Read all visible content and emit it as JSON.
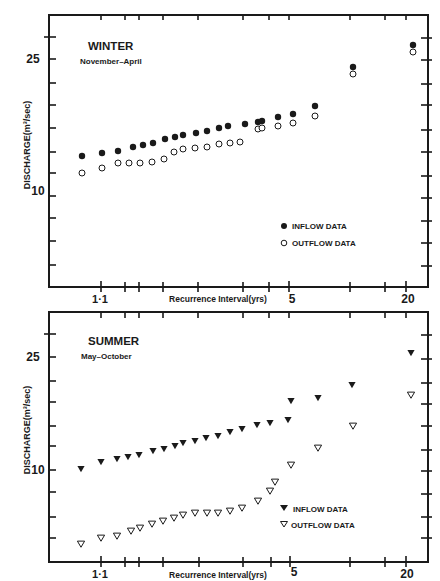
{
  "chart_data": [
    {
      "type": "scatter",
      "title": "WINTER",
      "subtitle": "November–April",
      "xlabel": "Recurrence Interval(yrs)",
      "ylabel": "DISCHARGE(m³/sec)",
      "xscale": "probability (log-extreme)",
      "x_tick_labels": [
        "1·1",
        "5",
        "20"
      ],
      "y_tick_labels": [
        "25",
        "10"
      ],
      "legend": [
        {
          "label": "INFLOW DATA",
          "marker": "filled-circle"
        },
        {
          "label": "OUTFLOW DATA",
          "marker": "open-circle"
        }
      ],
      "legend_position": "lower right",
      "grid": false,
      "series": [
        {
          "name": "INFLOW DATA",
          "marker": "filled-circle",
          "points_px": [
            [
              82,
              156
            ],
            [
              102,
              153
            ],
            [
              118,
              151
            ],
            [
              133,
              147
            ],
            [
              143,
              145
            ],
            [
              153,
              143
            ],
            [
              165,
              139
            ],
            [
              175,
              137
            ],
            [
              183,
              135
            ],
            [
              196,
              133
            ],
            [
              207,
              131
            ],
            [
              219,
              128
            ],
            [
              228,
              126
            ],
            [
              245,
              124
            ],
            [
              258,
              122
            ],
            [
              262,
              121
            ],
            [
              278,
              117
            ],
            [
              293,
              114
            ],
            [
              315,
              106
            ],
            [
              353,
              67
            ],
            [
              413,
              45
            ]
          ],
          "recurrence_yrs": [
            1.02,
            1.1,
            1.15,
            1.2,
            1.25,
            1.3,
            1.38,
            1.45,
            1.52,
            1.6,
            1.7,
            1.85,
            2.0,
            2.3,
            2.6,
            2.8,
            3.3,
            4.0,
            5.5,
            10,
            22
          ],
          "discharge_m3s": [
            14.5,
            15,
            15.3,
            15.8,
            16,
            16.3,
            16.8,
            17.2,
            17.5,
            17.8,
            18.1,
            18.6,
            19,
            19.4,
            19.8,
            20,
            20.6,
            21.2,
            22.8,
            30,
            35
          ]
        },
        {
          "name": "OUTFLOW DATA",
          "marker": "open-circle",
          "points_px": [
            [
              82,
              173
            ],
            [
              102,
              168
            ],
            [
              118,
              163
            ],
            [
              129,
              163
            ],
            [
              140,
              163
            ],
            [
              152,
              162
            ],
            [
              164,
              159
            ],
            [
              174,
              152
            ],
            [
              183,
              149
            ],
            [
              195,
              148
            ],
            [
              207,
              147
            ],
            [
              219,
              144
            ],
            [
              230,
              143
            ],
            [
              240,
              142
            ],
            [
              258,
              129
            ],
            [
              262,
              128
            ],
            [
              278,
              126
            ],
            [
              293,
              123
            ],
            [
              315,
              116
            ],
            [
              353,
              74
            ],
            [
              413,
              52
            ]
          ],
          "recurrence_yrs": [
            1.02,
            1.1,
            1.15,
            1.2,
            1.25,
            1.3,
            1.38,
            1.45,
            1.52,
            1.6,
            1.7,
            1.85,
            2.0,
            2.3,
            2.6,
            2.8,
            3.3,
            4.0,
            5.5,
            10,
            22
          ],
          "discharge_m3s": [
            12.3,
            12.8,
            13.3,
            13.3,
            13.3,
            13.4,
            13.7,
            14.4,
            14.8,
            15,
            15.1,
            15.5,
            15.6,
            15.7,
            17.3,
            17.4,
            17.8,
            18.2,
            19.4,
            28,
            33.5
          ]
        }
      ]
    },
    {
      "type": "scatter",
      "title": "SUMMER",
      "subtitle": "May–October",
      "xlabel": "Recurrence Interval(yrs)",
      "ylabel": "DISCHARGE(m³/sec)",
      "xscale": "probability (log-extreme)",
      "x_tick_labels": [
        "1·1",
        "5",
        "20"
      ],
      "y_tick_labels": [
        "25",
        "10"
      ],
      "legend": [
        {
          "label": "INFLOW DATA",
          "marker": "filled-triangle-down"
        },
        {
          "label": "OUTFLOW DATA",
          "marker": "open-triangle-down"
        }
      ],
      "legend_position": "lower right",
      "grid": false,
      "series": [
        {
          "name": "INFLOW DATA",
          "marker": "filled-triangle-down",
          "points_px": [
            [
              81,
              469
            ],
            [
              101,
              462
            ],
            [
              117,
              459
            ],
            [
              128,
              457
            ],
            [
              139,
              455
            ],
            [
              153,
              451
            ],
            [
              164,
              449
            ],
            [
              175,
              446
            ],
            [
              183,
              443
            ],
            [
              195,
              441
            ],
            [
              206,
              438
            ],
            [
              218,
              436
            ],
            [
              230,
              432
            ],
            [
              242,
              429
            ],
            [
              257,
              425
            ],
            [
              270,
              423
            ],
            [
              288,
              420
            ],
            [
              291,
              401
            ],
            [
              318,
              398
            ],
            [
              352,
              385
            ],
            [
              411,
              353
            ]
          ],
          "recurrence_yrs": [
            1.02,
            1.1,
            1.15,
            1.2,
            1.25,
            1.3,
            1.38,
            1.45,
            1.52,
            1.6,
            1.7,
            1.85,
            2.0,
            2.3,
            2.6,
            3.0,
            3.8,
            5.0,
            6.5,
            10,
            21
          ],
          "discharge_m3s": [
            10.2,
            10.8,
            11,
            11.2,
            11.4,
            11.7,
            11.9,
            12.2,
            12.4,
            12.6,
            12.9,
            13.1,
            13.5,
            13.8,
            14.2,
            14.4,
            14.8,
            16.5,
            17,
            18.5,
            23.5
          ]
        },
        {
          "name": "OUTFLOW DATA",
          "marker": "open-triangle-down",
          "points_px": [
            [
              81,
              544
            ],
            [
              101,
              538
            ],
            [
              117,
              536
            ],
            [
              131,
              531
            ],
            [
              140,
              528
            ],
            [
              152,
              524
            ],
            [
              163,
              521
            ],
            [
              174,
              518
            ],
            [
              183,
              515
            ],
            [
              195,
              513
            ],
            [
              207,
              513
            ],
            [
              218,
              513
            ],
            [
              230,
              511
            ],
            [
              242,
              508
            ],
            [
              258,
              501
            ],
            [
              270,
              491
            ],
            [
              275,
              482
            ],
            [
              291,
              465
            ],
            [
              318,
              448
            ],
            [
              353,
              426
            ],
            [
              411,
              395
            ]
          ],
          "recurrence_yrs": [
            1.02,
            1.1,
            1.15,
            1.2,
            1.25,
            1.3,
            1.38,
            1.45,
            1.52,
            1.6,
            1.7,
            1.85,
            2.0,
            2.3,
            2.6,
            3.0,
            3.4,
            5.0,
            6.5,
            10,
            21
          ],
          "discharge_m3s": [
            5.5,
            5.8,
            5.9,
            6.2,
            6.4,
            6.6,
            6.8,
            7,
            7.2,
            7.3,
            7.3,
            7.3,
            7.4,
            7.6,
            8,
            8.6,
            9.2,
            10.4,
            11.8,
            14.5,
            19.5
          ]
        }
      ]
    }
  ],
  "panels": {
    "winter": {
      "title": "WINTER",
      "subtitle": "November–April",
      "legend_inflow": "INFLOW DATA",
      "legend_outflow": "OUTFLOW DATA",
      "y_label_25": "25",
      "y_label_10": "10",
      "x_label_1_1": "1·1",
      "x_label_5": "5",
      "x_label_20": "20",
      "x_axis_title": "Recurrence Interval(yrs)",
      "y_axis_title": "DISCHARGE(m³/sec)"
    },
    "summer": {
      "title": "SUMMER",
      "subtitle": "May–October",
      "legend_inflow": "INFLOW DATA",
      "legend_outflow": "OUTFLOW DATA",
      "y_label_25": "25",
      "y_label_10": "10",
      "x_label_1_1": "1·1",
      "x_label_5": "5",
      "x_label_20": "20",
      "x_axis_title": "Recurrence Interval(yrs)",
      "y_axis_title": "DISCHARGE(m³/sec)"
    }
  },
  "colors": {
    "ink": "#1a1a1a",
    "background": "#ffffff"
  }
}
